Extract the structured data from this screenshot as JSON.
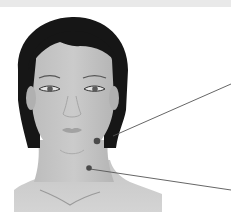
{
  "diagram": {
    "colors": {
      "background": "#ffffff",
      "top_band": "#e9e9e9",
      "hair": "#1a1a1a",
      "skin": "#c4c4c4",
      "skin_shadow": "#a8a8a8",
      "point": "#4a4a4a",
      "leader_line": "#555555"
    },
    "points": [
      {
        "name": "jaw-point",
        "x": 97,
        "y": 141,
        "line_to": [
          231,
          84
        ]
      },
      {
        "name": "neck-point",
        "x": 89,
        "y": 168,
        "line_to": [
          231,
          190
        ]
      }
    ]
  }
}
